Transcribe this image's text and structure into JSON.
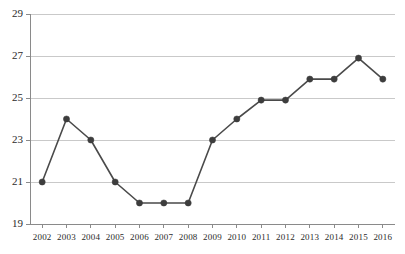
{
  "chart_data": {
    "type": "line",
    "title": "",
    "subtitle": "",
    "xlabel": "",
    "ylabel": "",
    "categories": [
      "2002",
      "2003",
      "2004",
      "2005",
      "2006",
      "2007",
      "2008",
      "2009",
      "2010",
      "2011",
      "2012",
      "2013",
      "2014",
      "2015",
      "2016"
    ],
    "values": [
      21,
      24,
      23,
      21,
      20,
      20,
      20,
      23,
      24,
      24.9,
      24.9,
      25.9,
      25.9,
      26.9,
      25.9
    ],
    "series": [
      {
        "name": "",
        "values": [
          21,
          24,
          23,
          21,
          20,
          20,
          20,
          23,
          24,
          24.9,
          24.9,
          25.9,
          25.9,
          26.9,
          25.9
        ]
      }
    ],
    "ylim": [
      19,
      29
    ],
    "xlim": [
      "2002",
      "2016"
    ],
    "y_ticks": [
      19,
      21,
      23,
      25,
      27,
      29
    ],
    "y_tick_labels": [
      "19",
      "21",
      "23",
      "25",
      "27",
      "29"
    ],
    "x_ticks": [
      "2002",
      "2003",
      "2004",
      "2005",
      "2006",
      "2007",
      "2008",
      "2009",
      "2010",
      "2011",
      "2012",
      "2013",
      "2014",
      "2015",
      "2016"
    ],
    "grid": "horizontal",
    "legend": "none",
    "markers": "circle",
    "annotations": []
  },
  "style": {
    "line_color": "#4a4a4a",
    "marker_color": "#3d3d3d",
    "grid_color": "#c9c9c9",
    "axis_color": "#8a8a8a",
    "tick_color": "#8a8a8a",
    "text_color": "#2b2b2b",
    "background": "#ffffff"
  },
  "plot_geometry": {
    "left": 30,
    "right": 395,
    "top": 14,
    "bottom": 224
  }
}
